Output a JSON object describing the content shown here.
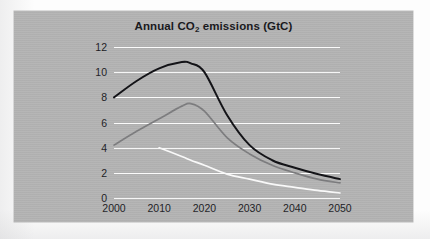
{
  "figure": {
    "panel_color": "#b3b3b3",
    "gridline_color": "#fbfbfb"
  },
  "chart_data": {
    "type": "line",
    "title": "Annual CO2 emissions (GtC)",
    "title_main": "Annual CO",
    "title_sub": "2",
    "title_rest": " emissions (GtC)",
    "xlabel": "",
    "ylabel": "",
    "xlim": [
      2000,
      2050
    ],
    "ylim": [
      0,
      12
    ],
    "grid": true,
    "legend": "none",
    "xticks": [
      "2000",
      "2010",
      "2020",
      "2030",
      "2040",
      "2050"
    ],
    "xtick_values": [
      2000,
      2010,
      2020,
      2030,
      2040,
      2050
    ],
    "yticks": [
      "0",
      "2",
      "4",
      "6",
      "8",
      "10",
      "12"
    ],
    "ytick_values": [
      0,
      2,
      4,
      6,
      8,
      10,
      12
    ],
    "x": [
      2000,
      2005,
      2010,
      2015,
      2017,
      2020,
      2025,
      2030,
      2035,
      2040,
      2045,
      2050
    ],
    "series": [
      {
        "name": "high-emissions-scenario",
        "color": "#101014",
        "values": [
          8.0,
          9.3,
          10.3,
          10.8,
          10.7,
          10.0,
          6.6,
          4.2,
          3.0,
          2.4,
          1.9,
          1.5
        ]
      },
      {
        "name": "medium-emissions-scenario",
        "color": "#7c7c7e",
        "values": [
          4.2,
          5.3,
          6.3,
          7.3,
          7.5,
          6.9,
          4.8,
          3.5,
          2.6,
          2.0,
          1.5,
          1.2
        ]
      },
      {
        "name": "low-emissions-scenario",
        "color": "#fbfbfb",
        "values": [
          null,
          null,
          4.0,
          3.3,
          3.0,
          2.6,
          1.9,
          1.5,
          1.1,
          0.85,
          0.6,
          0.4
        ]
      }
    ]
  }
}
